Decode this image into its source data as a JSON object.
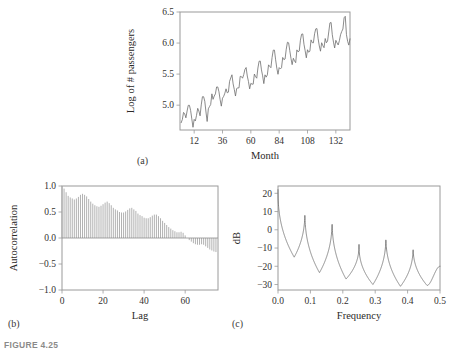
{
  "figure": {
    "caption": "FIGURE 4.25",
    "panel_tags": {
      "a": "(a)",
      "b": "(b)",
      "c": "(c)"
    }
  },
  "chart_data": [
    {
      "id": "panel-a",
      "type": "line",
      "title": "",
      "xlabel": "Month",
      "ylabel": "Log of # passengers",
      "xlim": [
        0,
        144
      ],
      "ylim": [
        4.6,
        6.5
      ],
      "xticks": [
        12,
        36,
        60,
        84,
        108,
        132
      ],
      "yticks": [
        5.0,
        5.5,
        6.0,
        6.5
      ],
      "ytick_labels": [
        "5.0",
        "5.5",
        "6.0",
        "6.5"
      ],
      "xtick_labels": [
        "12",
        "36",
        "60",
        "84",
        "108",
        "132"
      ],
      "grid": false,
      "legend": "none",
      "x": [
        1,
        2,
        3,
        4,
        5,
        6,
        7,
        8,
        9,
        10,
        11,
        12,
        13,
        14,
        15,
        16,
        17,
        18,
        19,
        20,
        21,
        22,
        23,
        24,
        25,
        26,
        27,
        28,
        29,
        30,
        31,
        32,
        33,
        34,
        35,
        36,
        37,
        38,
        39,
        40,
        41,
        42,
        43,
        44,
        45,
        46,
        47,
        48,
        49,
        50,
        51,
        52,
        53,
        54,
        55,
        56,
        57,
        58,
        59,
        60,
        61,
        62,
        63,
        64,
        65,
        66,
        67,
        68,
        69,
        70,
        71,
        72,
        73,
        74,
        75,
        76,
        77,
        78,
        79,
        80,
        81,
        82,
        83,
        84,
        85,
        86,
        87,
        88,
        89,
        90,
        91,
        92,
        93,
        94,
        95,
        96,
        97,
        98,
        99,
        100,
        101,
        102,
        103,
        104,
        105,
        106,
        107,
        108,
        109,
        110,
        111,
        112,
        113,
        114,
        115,
        116,
        117,
        118,
        119,
        120,
        121,
        122,
        123,
        124,
        125,
        126,
        127,
        128,
        129,
        130,
        131,
        132,
        133,
        134,
        135,
        136,
        137,
        138,
        139,
        140,
        141,
        142,
        143,
        144
      ],
      "values": [
        4.718,
        4.771,
        4.883,
        4.86,
        4.796,
        4.905,
        4.997,
        4.997,
        4.913,
        4.779,
        4.644,
        4.771,
        4.745,
        4.836,
        4.949,
        4.905,
        4.828,
        5.004,
        5.136,
        5.136,
        5.063,
        4.89,
        4.737,
        4.942,
        4.977,
        5.011,
        5.182,
        5.094,
        5.147,
        5.182,
        5.293,
        5.293,
        5.215,
        5.088,
        4.984,
        5.112,
        5.142,
        5.193,
        5.263,
        5.199,
        5.209,
        5.384,
        5.438,
        5.489,
        5.342,
        5.252,
        5.147,
        5.268,
        5.278,
        5.278,
        5.464,
        5.46,
        5.434,
        5.493,
        5.576,
        5.606,
        5.469,
        5.379,
        5.262,
        5.351,
        5.338,
        5.338,
        5.501,
        5.46,
        5.434,
        5.598,
        5.707,
        5.71,
        5.568,
        5.472,
        5.347,
        5.488,
        5.451,
        5.488,
        5.649,
        5.624,
        5.603,
        5.768,
        5.886,
        5.886,
        5.73,
        5.596,
        5.497,
        5.605,
        5.583,
        5.602,
        5.768,
        5.733,
        5.743,
        5.902,
        6.013,
        6.004,
        5.877,
        5.752,
        5.652,
        5.755,
        5.713,
        5.684,
        5.89,
        5.858,
        5.872,
        6.046,
        6.142,
        6.147,
        5.981,
        5.878,
        5.762,
        5.892,
        5.852,
        5.869,
        6.051,
        6.007,
        6.003,
        6.15,
        6.228,
        6.233,
        6.069,
        5.953,
        5.869,
        6.005,
        5.958,
        5.925,
        6.073,
        6.004,
        6.033,
        6.179,
        6.325,
        6.331,
        6.134,
        6.015,
        5.921,
        6.044,
        6.003,
        5.969,
        6.038,
        6.134,
        6.187,
        6.226,
        6.407,
        6.431,
        6.134,
        6.028,
        5.967,
        6.068
      ]
    },
    {
      "id": "panel-b",
      "type": "bar",
      "title": "",
      "xlabel": "Lag",
      "ylabel": "Autocorrelation",
      "xlim": [
        0,
        76
      ],
      "ylim": [
        -1.0,
        1.0
      ],
      "xticks": [
        0,
        20,
        40,
        60
      ],
      "yticks": [
        -1.0,
        -0.5,
        0.0,
        0.5,
        1.0
      ],
      "xtick_labels": [
        "0",
        "20",
        "40",
        "60"
      ],
      "ytick_labels": [
        "-1.0",
        "-0.5",
        "0.0",
        "0.5",
        "1.0"
      ],
      "grid": false,
      "legend": "none",
      "categories": [
        0,
        1,
        2,
        3,
        4,
        5,
        6,
        7,
        8,
        9,
        10,
        11,
        12,
        13,
        14,
        15,
        16,
        17,
        18,
        19,
        20,
        21,
        22,
        23,
        24,
        25,
        26,
        27,
        28,
        29,
        30,
        31,
        32,
        33,
        34,
        35,
        36,
        37,
        38,
        39,
        40,
        41,
        42,
        43,
        44,
        45,
        46,
        47,
        48,
        49,
        50,
        51,
        52,
        53,
        54,
        55,
        56,
        57,
        58,
        59,
        60,
        61,
        62,
        63,
        64,
        65,
        66,
        67,
        68,
        69,
        70,
        71,
        72,
        73,
        74,
        75
      ],
      "values": [
        1.0,
        0.95,
        0.88,
        0.81,
        0.78,
        0.76,
        0.74,
        0.76,
        0.79,
        0.83,
        0.85,
        0.83,
        0.8,
        0.75,
        0.7,
        0.66,
        0.63,
        0.61,
        0.6,
        0.62,
        0.65,
        0.68,
        0.7,
        0.67,
        0.63,
        0.58,
        0.55,
        0.53,
        0.5,
        0.49,
        0.49,
        0.51,
        0.54,
        0.57,
        0.58,
        0.55,
        0.52,
        0.47,
        0.44,
        0.42,
        0.39,
        0.38,
        0.38,
        0.4,
        0.43,
        0.45,
        0.45,
        0.42,
        0.38,
        0.33,
        0.29,
        0.25,
        0.21,
        0.18,
        0.15,
        0.13,
        0.11,
        0.11,
        0.12,
        0.1,
        0.05,
        0.0,
        -0.04,
        -0.07,
        -0.1,
        -0.12,
        -0.13,
        -0.13,
        -0.12,
        -0.13,
        -0.16,
        -0.19,
        -0.22,
        -0.24,
        -0.26,
        -0.27
      ]
    },
    {
      "id": "panel-c",
      "type": "line",
      "title": "",
      "xlabel": "Frequency",
      "ylabel": "dB",
      "xlim": [
        0.0,
        0.5
      ],
      "ylim": [
        -33,
        24
      ],
      "xticks": [
        0.0,
        0.1,
        0.2,
        0.3,
        0.4,
        0.5
      ],
      "yticks": [
        -30,
        -20,
        -10,
        0,
        10,
        20
      ],
      "xtick_labels": [
        "0.0",
        "0.1",
        "0.2",
        "0.3",
        "0.4",
        "0.5"
      ],
      "ytick_labels": [
        "-30",
        "-20",
        "-10",
        "0",
        "10",
        "20"
      ],
      "grid": false,
      "legend": "none",
      "peaks": [
        {
          "frequency": 0.0,
          "db": 22.0
        },
        {
          "frequency": 0.083,
          "db": 10.5
        },
        {
          "frequency": 0.167,
          "db": 6.0
        },
        {
          "frequency": 0.25,
          "db": -8.0
        },
        {
          "frequency": 0.333,
          "db": -3.0
        },
        {
          "frequency": 0.417,
          "db": -9.0
        }
      ],
      "troughs": [
        {
          "frequency": 0.05,
          "db": -15.0
        },
        {
          "frequency": 0.128,
          "db": -23.5
        },
        {
          "frequency": 0.21,
          "db": -27.0
        },
        {
          "frequency": 0.293,
          "db": -30.0
        },
        {
          "frequency": 0.378,
          "db": -31.0
        },
        {
          "frequency": 0.46,
          "db": -30.5
        },
        {
          "frequency": 0.5,
          "db": -20.0
        }
      ]
    }
  ]
}
